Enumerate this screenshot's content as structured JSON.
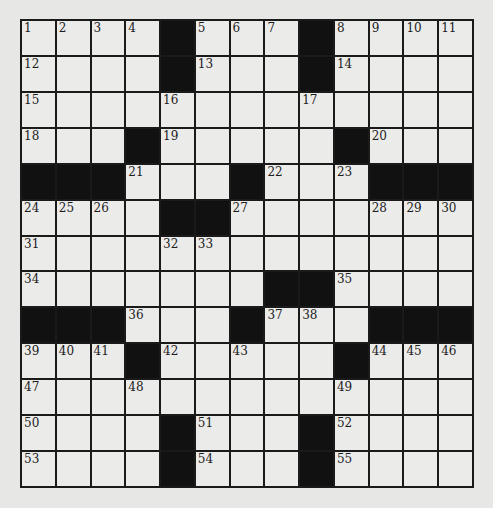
{
  "puzzle": {
    "rows": 13,
    "cols": 13,
    "colors": {
      "background": "#e7e7e5",
      "cell": "#ebebea",
      "block": "#111111",
      "line": "#1a1a1a"
    },
    "grid": [
      [
        "1",
        "2",
        "3",
        "4",
        "#",
        "5",
        "6",
        "7",
        "#",
        "8",
        "9",
        "10",
        "11"
      ],
      [
        "12",
        ".",
        ".",
        ".",
        "#",
        "13",
        ".",
        ".",
        "#",
        "14",
        ".",
        ".",
        "."
      ],
      [
        "15",
        ".",
        ".",
        ".",
        "16",
        ".",
        ".",
        ".",
        "17",
        ".",
        ".",
        ".",
        "."
      ],
      [
        "18",
        ".",
        ".",
        "#",
        "19",
        ".",
        ".",
        ".",
        ".",
        "#",
        "20",
        ".",
        "."
      ],
      [
        "#",
        "#",
        "#",
        "21",
        ".",
        ".",
        "#",
        "22",
        ".",
        "23",
        "#",
        "#",
        "#"
      ],
      [
        "24",
        "25",
        "26",
        ".",
        "#",
        "#",
        "27",
        ".",
        ".",
        ".",
        "28",
        "29",
        "30"
      ],
      [
        "31",
        ".",
        ".",
        ".",
        "32",
        "33",
        ".",
        ".",
        ".",
        ".",
        ".",
        ".",
        "."
      ],
      [
        "34",
        ".",
        ".",
        ".",
        ".",
        ".",
        ".",
        "#",
        "#",
        "35",
        ".",
        ".",
        "."
      ],
      [
        "#",
        "#",
        "#",
        "36",
        ".",
        ".",
        "#",
        "37",
        "38",
        ".",
        "#",
        "#",
        "#"
      ],
      [
        "39",
        "40",
        "41",
        "#",
        "42",
        ".",
        "43",
        ".",
        ".",
        "#",
        "44",
        "45",
        "46"
      ],
      [
        "47",
        ".",
        ".",
        "48",
        ".",
        ".",
        ".",
        ".",
        ".",
        "49",
        ".",
        ".",
        "."
      ],
      [
        "50",
        ".",
        ".",
        ".",
        "#",
        "51",
        ".",
        ".",
        "#",
        "52",
        ".",
        ".",
        "."
      ],
      [
        "53",
        ".",
        ".",
        ".",
        "#",
        "54",
        ".",
        ".",
        "#",
        "55",
        ".",
        ".",
        "."
      ]
    ]
  }
}
